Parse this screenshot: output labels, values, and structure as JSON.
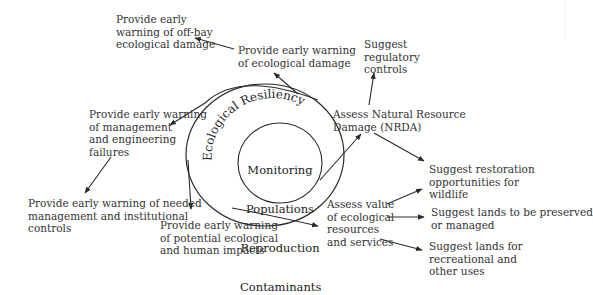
{
  "diagram": {
    "core": {
      "outer_ring_label": "Ecological Resiliency",
      "inner_lines": [
        "Monitoring",
        "Populations",
        "Reproduction",
        "Contaminants"
      ]
    },
    "nodes": {
      "offbay": "Provide early warning\nwarning of off-bay\necological damage",
      "eco_damage": "Provide early warning\nof ecological damage",
      "mgmt_eng": "Provide early warning\nof management\nand engineering\nfailures",
      "needed_controls": "Provide early warning of needed\nmanagement and institutional\ncontrols",
      "potential_impacts": "Provide early warning\nof potential ecological\nand human impacts",
      "regulatory": "Suggest\nregulatory\ncontrols",
      "nrda": "Assess Natural Resource\nDamage (NRDA)",
      "restoration": "Suggest restoration\nopportunities for\nwildlife",
      "assess_value": "Assess value\nof ecological\nresources\nand services",
      "preserve": "Suggest lands to be preserved\nor managed",
      "recreation": "Suggest lands for\nrecreational and\nother uses"
    },
    "edges": [
      {
        "from": "eco_damage",
        "to": "offbay"
      },
      {
        "from": "core",
        "to": "eco_damage"
      },
      {
        "from": "core",
        "to": "mgmt_eng"
      },
      {
        "from": "mgmt_eng",
        "to": "needed_controls"
      },
      {
        "from": "core",
        "to": "potential_impacts"
      },
      {
        "from": "core",
        "to": "nrda"
      },
      {
        "from": "nrda",
        "to": "regulatory"
      },
      {
        "from": "nrda",
        "to": "restoration"
      },
      {
        "from": "core",
        "to": "assess_value"
      },
      {
        "from": "assess_value",
        "to": "restoration"
      },
      {
        "from": "assess_value",
        "to": "preserve"
      },
      {
        "from": "assess_value",
        "to": "recreation"
      }
    ],
    "colors": {
      "ink": "#2a2a2a",
      "background": "#ffffff"
    }
  }
}
